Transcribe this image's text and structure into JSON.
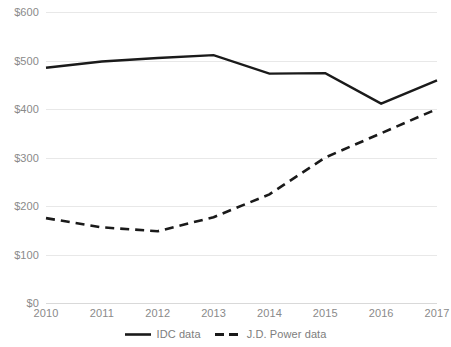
{
  "chart_data": {
    "type": "line",
    "title": "",
    "xlabel": "",
    "ylabel": "",
    "x": [
      2010,
      2011,
      2012,
      2013,
      2014,
      2015,
      2016,
      2017
    ],
    "categories": [
      "2010",
      "2011",
      "2012",
      "2013",
      "2014",
      "2015",
      "2016",
      "2017"
    ],
    "series": [
      {
        "name": "IDC data",
        "style": "solid",
        "color": "#1a1a1a",
        "values": [
          485,
          498,
          505,
          511,
          473,
          474,
          411,
          459
        ]
      },
      {
        "name": "J.D. Power data",
        "style": "dashed",
        "color": "#1a1a1a",
        "values": [
          175,
          156,
          148,
          177,
          224,
          300,
          350,
          400
        ]
      }
    ],
    "ylim": [
      0,
      600
    ],
    "yticks": [
      0,
      100,
      200,
      300,
      400,
      500,
      600
    ],
    "ytick_labels": [
      "$0",
      "$100",
      "$200",
      "$300",
      "$400",
      "$500",
      "$600"
    ],
    "xtick_labels": [
      "2010",
      "2011",
      "2012",
      "2013",
      "2014",
      "2015",
      "2016",
      "2017"
    ],
    "grid": true,
    "grid_axis": "y",
    "legend_position": "bottom",
    "legend_entries": [
      "IDC data",
      "J.D. Power data"
    ]
  },
  "axis": {
    "y_ticks": [
      {
        "label": "$600",
        "value": 600
      },
      {
        "label": "$500",
        "value": 500
      },
      {
        "label": "$400",
        "value": 400
      },
      {
        "label": "$300",
        "value": 300
      },
      {
        "label": "$200",
        "value": 200
      },
      {
        "label": "$100",
        "value": 100
      },
      {
        "label": "$0",
        "value": 0
      }
    ],
    "x_ticks": [
      {
        "label": "2010"
      },
      {
        "label": "2011"
      },
      {
        "label": "2012"
      },
      {
        "label": "2013"
      },
      {
        "label": "2014"
      },
      {
        "label": "2015"
      },
      {
        "label": "2016"
      },
      {
        "label": "2017"
      }
    ]
  },
  "legend": {
    "items": [
      {
        "label": "IDC data",
        "icon": "solid-line-swatch-icon"
      },
      {
        "label": "J.D. Power data",
        "icon": "dashed-line-swatch-icon"
      }
    ]
  },
  "colors": {
    "series_line": "#1a1a1a",
    "gridline": "#e8e8e8",
    "axis_text": "#8a8a8a",
    "legend_text": "#7d7d7d",
    "background": "#ffffff"
  }
}
